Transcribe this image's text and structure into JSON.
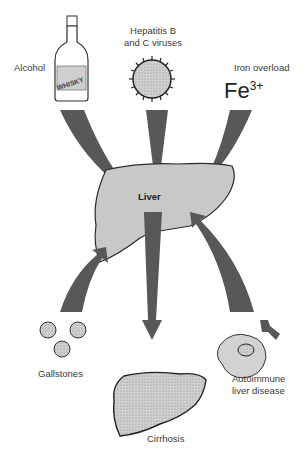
{
  "diagram": {
    "center": {
      "label": "Liver"
    },
    "causes": [
      {
        "id": "alcohol",
        "label": "Alcohol",
        "icon_text": "WHISKY",
        "icon": "whisky-bottle"
      },
      {
        "id": "hepatitis",
        "label_line1": "Hepatitis B",
        "label_line2": "and C viruses",
        "icon": "virus"
      },
      {
        "id": "iron",
        "label": "Iron overload",
        "formula_base": "Fe",
        "formula_sup": "3+"
      },
      {
        "id": "gallstones",
        "label": "Gallstones",
        "icon": "gallstones"
      },
      {
        "id": "autoimmune",
        "label_line1": "Autoimmune",
        "label_line2": "liver disease",
        "icon": "cell-antibody"
      }
    ],
    "outcome": {
      "label": "Cirrhosis",
      "icon": "cirrhotic-liver"
    },
    "colors": {
      "arrow": "#585858",
      "liver_fill": "#c8c8c8",
      "outline": "#2a2a2a",
      "text": "#3a3a3a"
    }
  }
}
